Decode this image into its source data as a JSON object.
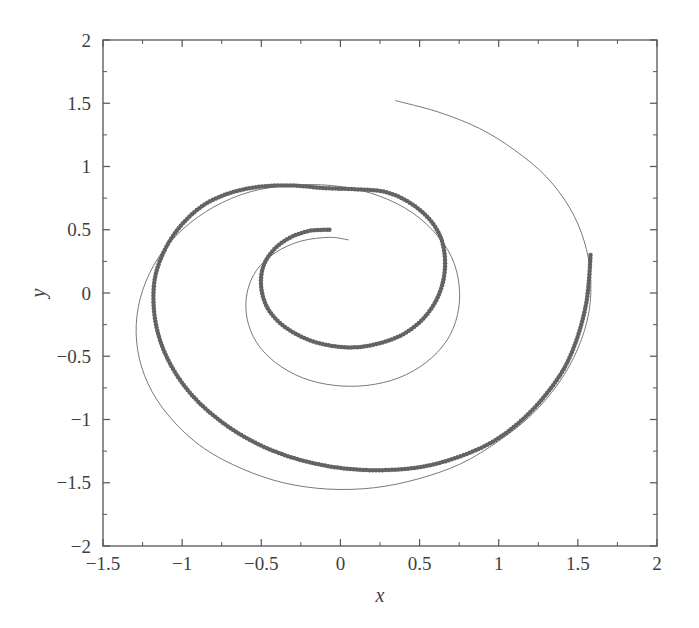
{
  "chart_data": {
    "type": "scatter",
    "title": "",
    "xlabel": "x",
    "ylabel": "y",
    "xlim": [
      -1.5,
      2
    ],
    "ylim": [
      -2,
      2
    ],
    "xticks": [
      -1.5,
      -1,
      -0.5,
      0,
      0.5,
      1,
      1.5,
      2
    ],
    "xticklabels": [
      "−1.5",
      "−1",
      "−0.5",
      "0",
      "0.5",
      "1",
      "1.5",
      "2"
    ],
    "yticks": [
      -2,
      -1.5,
      -1,
      -0.5,
      0,
      0.5,
      1,
      1.5,
      2
    ],
    "yticklabels": [
      "−2",
      "−1.5",
      "−1",
      "−0.5",
      "0",
      "0.5",
      "1",
      "1.5",
      "2"
    ],
    "minor_ticks_per_interval": 1,
    "tick_direction": "in",
    "grid": false,
    "legend": null,
    "frame": "box",
    "colors": {
      "line": "#6a6a6a",
      "markers": "#636363",
      "axis": "#555555",
      "background": "#ffffff"
    },
    "series": [
      {
        "name": "reference-spiral-line",
        "style": "solid-thin-line",
        "color": "#6a6a6a",
        "linewidth": 0.9,
        "description": "Thin continuous spiral curve, outer trace. Parametric spiral r = a + b*theta traversed clockwise from outer end near (0.35, 1.52) inward to (0.05, 0.42).",
        "param": {
          "theta_start_deg": 78,
          "theta_end_deg": 760,
          "r_start": 1.56,
          "r_end": 0.42,
          "center": [
            0.04,
            -0.02
          ],
          "direction": "clockwise-inward"
        },
        "points": [
          [
            0.35,
            1.52
          ],
          [
            0.62,
            1.43
          ],
          [
            0.88,
            1.3
          ],
          [
            1.1,
            1.13
          ],
          [
            1.3,
            0.92
          ],
          [
            1.45,
            0.67
          ],
          [
            1.54,
            0.41
          ],
          [
            1.58,
            0.14
          ],
          [
            1.57,
            -0.15
          ],
          [
            1.5,
            -0.44
          ],
          [
            1.38,
            -0.71
          ],
          [
            1.21,
            -0.96
          ],
          [
            1.0,
            -1.17
          ],
          [
            0.76,
            -1.35
          ],
          [
            0.49,
            -1.47
          ],
          [
            0.21,
            -1.54
          ],
          [
            -0.08,
            -1.55
          ],
          [
            -0.36,
            -1.5
          ],
          [
            -0.62,
            -1.39
          ],
          [
            -0.86,
            -1.23
          ],
          [
            -1.05,
            -1.02
          ],
          [
            -1.19,
            -0.78
          ],
          [
            -1.27,
            -0.52
          ],
          [
            -1.29,
            -0.25
          ],
          [
            -1.25,
            0.02
          ],
          [
            -1.15,
            0.28
          ],
          [
            -1.0,
            0.5
          ],
          [
            -0.8,
            0.68
          ],
          [
            -0.57,
            0.8
          ],
          [
            -0.32,
            0.85
          ],
          [
            -0.06,
            0.85
          ],
          [
            0.19,
            0.79
          ],
          [
            0.41,
            0.67
          ],
          [
            0.58,
            0.5
          ],
          [
            0.7,
            0.29
          ],
          [
            0.75,
            0.06
          ],
          [
            0.74,
            -0.17
          ],
          [
            0.67,
            -0.38
          ],
          [
            0.54,
            -0.55
          ],
          [
            0.37,
            -0.67
          ],
          [
            0.17,
            -0.73
          ],
          [
            -0.04,
            -0.73
          ],
          [
            -0.24,
            -0.67
          ],
          [
            -0.41,
            -0.55
          ],
          [
            -0.53,
            -0.39
          ],
          [
            -0.59,
            -0.2
          ],
          [
            -0.59,
            0.0
          ],
          [
            -0.53,
            0.18
          ],
          [
            -0.41,
            0.32
          ],
          [
            -0.25,
            0.41
          ],
          [
            -0.07,
            0.44
          ],
          [
            0.05,
            0.42
          ]
        ]
      },
      {
        "name": "measured-spiral-markers",
        "style": "dotted-markers",
        "color": "#636363",
        "marker": "circle",
        "markersize": 4.5,
        "description": "Dense round markers forming a spiral that lies slightly inside the thin line over most of the path; the two traces cross and nearly overlap near the upper-left and right portions. Outer marker end at (1.58, 0.30), inner end at (-0.07, 0.50).",
        "param": {
          "theta_start_deg": 100,
          "theta_end_deg": 745,
          "r_start": 1.5,
          "r_end": 0.5,
          "center": [
            0.04,
            -0.02
          ],
          "direction": "clockwise-inward"
        },
        "points": [
          [
            1.58,
            0.3
          ],
          [
            1.57,
            0.1
          ],
          [
            1.55,
            -0.1
          ],
          [
            1.5,
            -0.34
          ],
          [
            1.42,
            -0.58
          ],
          [
            1.3,
            -0.8
          ],
          [
            1.15,
            -1.0
          ],
          [
            0.97,
            -1.17
          ],
          [
            0.76,
            -1.29
          ],
          [
            0.53,
            -1.37
          ],
          [
            0.29,
            -1.4
          ],
          [
            0.05,
            -1.39
          ],
          [
            -0.19,
            -1.34
          ],
          [
            -0.42,
            -1.25
          ],
          [
            -0.63,
            -1.12
          ],
          [
            -0.82,
            -0.95
          ],
          [
            -0.97,
            -0.76
          ],
          [
            -1.08,
            -0.55
          ],
          [
            -1.15,
            -0.33
          ],
          [
            -1.18,
            -0.1
          ],
          [
            -1.17,
            0.13
          ],
          [
            -1.11,
            0.34
          ],
          [
            -1.01,
            0.53
          ],
          [
            -0.87,
            0.69
          ],
          [
            -0.7,
            0.79
          ],
          [
            -0.51,
            0.84
          ],
          [
            -0.31,
            0.85
          ],
          [
            -0.11,
            0.83
          ],
          [
            0.09,
            0.82
          ],
          [
            0.28,
            0.8
          ],
          [
            0.43,
            0.72
          ],
          [
            0.55,
            0.6
          ],
          [
            0.63,
            0.45
          ],
          [
            0.66,
            0.28
          ],
          [
            0.65,
            0.1
          ],
          [
            0.6,
            -0.07
          ],
          [
            0.51,
            -0.22
          ],
          [
            0.39,
            -0.33
          ],
          [
            0.24,
            -0.4
          ],
          [
            0.08,
            -0.43
          ],
          [
            -0.09,
            -0.41
          ],
          [
            -0.24,
            -0.35
          ],
          [
            -0.37,
            -0.25
          ],
          [
            -0.46,
            -0.12
          ],
          [
            -0.5,
            0.04
          ],
          [
            -0.49,
            0.2
          ],
          [
            -0.43,
            0.33
          ],
          [
            -0.33,
            0.43
          ],
          [
            -0.2,
            0.49
          ],
          [
            -0.07,
            0.5
          ]
        ]
      }
    ]
  },
  "figure": {
    "plot_area_px": {
      "left": 103,
      "top": 40,
      "right": 657,
      "bottom": 546
    }
  }
}
